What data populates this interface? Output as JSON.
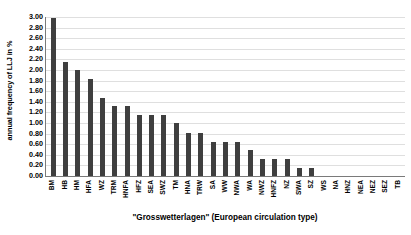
{
  "chart_data": {
    "type": "bar",
    "title": "",
    "xlabel": "\"Grosswetterlagen\" (European circulation type)",
    "ylabel": "annual frequency of LLJ in %",
    "ylim": [
      0,
      3.0
    ],
    "ytick_step": 0.2,
    "ytick_labels": [
      "3.00",
      "2.80",
      "2.60",
      "2.40",
      "2.20",
      "2.00",
      "1.80",
      "1.60",
      "1.40",
      "1.20",
      "1.00",
      "0.80",
      "0.60",
      "0.40",
      "0.20",
      "0.00"
    ],
    "ytick_values": [
      3.0,
      2.8,
      2.6,
      2.4,
      2.2,
      2.0,
      1.8,
      1.6,
      1.4,
      1.2,
      1.0,
      0.8,
      0.6,
      0.4,
      0.2,
      0.0
    ],
    "grid": true,
    "grid_axis": "y",
    "legend": false,
    "bar_color": "#3f3f3f",
    "categories": [
      "BM",
      "HB",
      "HM",
      "HFA",
      "WZ",
      "TRM",
      "HNFA",
      "HFZ",
      "SEA",
      "SWZ",
      "TM",
      "HNA",
      "TRW",
      "SA",
      "WW",
      "NWA",
      "WA",
      "NWZ",
      "HNFZ",
      "NZ",
      "SWA",
      "SZ",
      "WS",
      "NA",
      "HNZ",
      "NEA",
      "NEZ",
      "SEZ",
      "TB"
    ],
    "values": [
      2.99,
      2.15,
      2.0,
      1.83,
      1.48,
      1.32,
      1.32,
      1.16,
      1.16,
      1.16,
      1.0,
      0.82,
      0.82,
      0.65,
      0.65,
      0.65,
      0.5,
      0.33,
      0.33,
      0.33,
      0.15,
      0.15,
      0.0,
      0.0,
      0.0,
      0.0,
      0.0,
      0.0,
      0.0
    ]
  }
}
